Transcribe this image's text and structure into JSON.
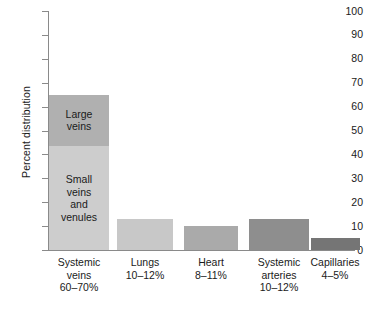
{
  "chart_data": {
    "type": "bar",
    "title": "",
    "subtitle": "",
    "xlabel": "",
    "ylabel": "Percent distribution",
    "ylim": [
      0,
      100
    ],
    "yticks": [
      0,
      10,
      20,
      30,
      40,
      50,
      60,
      70,
      80,
      90,
      100
    ],
    "ytick_labels": [
      "0",
      "10",
      "20",
      "30",
      "40",
      "50",
      "60",
      "70",
      "80",
      "90",
      "100"
    ],
    "grid": false,
    "legend": "none",
    "stacked": true,
    "categories": [
      "Systemic veins",
      "Lungs",
      "Heart",
      "Systemic arteries",
      "Capillaries"
    ],
    "category_ranges": [
      "60–70%",
      "10–12%",
      "8–11%",
      "10–12%",
      "4–5%"
    ],
    "values": [
      65,
      13,
      10,
      13,
      5
    ],
    "bars": [
      {
        "category": "Systemic veins",
        "range": "60–70%",
        "total": 65,
        "label_lines": [
          "Systemic",
          "veins",
          "60–70%"
        ],
        "segments": [
          {
            "name": "Small veins and venules",
            "from": 0,
            "to": 43.5,
            "value": 43.5,
            "color": "#cdcdcd",
            "label_lines": [
              "Small",
              "veins",
              "and",
              "venules"
            ]
          },
          {
            "name": "Large veins",
            "from": 43.5,
            "to": 65,
            "value": 21.5,
            "color": "#b0b0b0",
            "label_lines": [
              "Large",
              "veins"
            ]
          }
        ]
      },
      {
        "category": "Lungs",
        "range": "10–12%",
        "total": 13,
        "label_lines": [
          "Lungs",
          "10–12%"
        ],
        "segments": [
          {
            "name": "Lungs",
            "from": 0,
            "to": 13,
            "value": 13,
            "color": "#c8c8c8",
            "label_lines": []
          }
        ]
      },
      {
        "category": "Heart",
        "range": "8–11%",
        "total": 10,
        "label_lines": [
          "Heart",
          "8–11%"
        ],
        "segments": [
          {
            "name": "Heart",
            "from": 0,
            "to": 10,
            "value": 10,
            "color": "#aaaaaa",
            "label_lines": []
          }
        ]
      },
      {
        "category": "Systemic arteries",
        "range": "10–12%",
        "total": 13,
        "label_lines": [
          "Systemic",
          "arteries",
          "10–12%"
        ],
        "segments": [
          {
            "name": "Systemic arteries",
            "from": 0,
            "to": 13,
            "value": 13,
            "color": "#8e8e8e",
            "label_lines": []
          }
        ]
      },
      {
        "category": "Capillaries",
        "range": "4–5%",
        "total": 5,
        "label_lines": [
          "Capillaries",
          "4–5%"
        ],
        "segments": [
          {
            "name": "Capillaries",
            "from": 0,
            "to": 5,
            "value": 5,
            "color": "#757575",
            "label_lines": []
          }
        ]
      }
    ],
    "colors": {
      "axis": "#8a8a8a",
      "text": "#1a1a1a",
      "background": "#ffffff",
      "small_veins": "#cdcdcd",
      "large_veins": "#b0b0b0",
      "lungs": "#c8c8c8",
      "heart": "#aaaaaa",
      "systemic_arteries": "#8e8e8e",
      "capillaries": "#757575"
    }
  }
}
